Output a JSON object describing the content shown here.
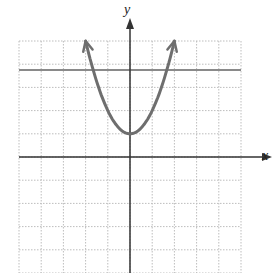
{
  "chart_data": {
    "type": "line",
    "title": "",
    "xlabel": "x",
    "ylabel": "y",
    "xlim": [
      -5,
      5
    ],
    "ylim": [
      -5,
      5
    ],
    "grid": true,
    "grid_style": "dotted",
    "series": [
      {
        "name": "parabola",
        "equation": "y = x^2 + 1",
        "x": [
          -2,
          -1.5,
          -1,
          -0.5,
          0,
          0.5,
          1,
          1.5,
          2
        ],
        "y": [
          5,
          3.25,
          2,
          1.25,
          1,
          1.25,
          2,
          3.25,
          5
        ],
        "arrows_at_ends": true,
        "color": "#6e6e6e"
      },
      {
        "name": "horizontal-line",
        "equation": "y = 3.75",
        "x": [
          -5,
          5
        ],
        "y": [
          3.75,
          3.75
        ],
        "color": "#8a8a8a"
      }
    ],
    "vertex": [
      0,
      1
    ]
  },
  "labels": {
    "x": "x",
    "y": "y"
  },
  "colors": {
    "grid": "#bdbdbd",
    "axis": "#333333",
    "curve": "#6e6e6e",
    "hline": "#8a8a8a"
  }
}
